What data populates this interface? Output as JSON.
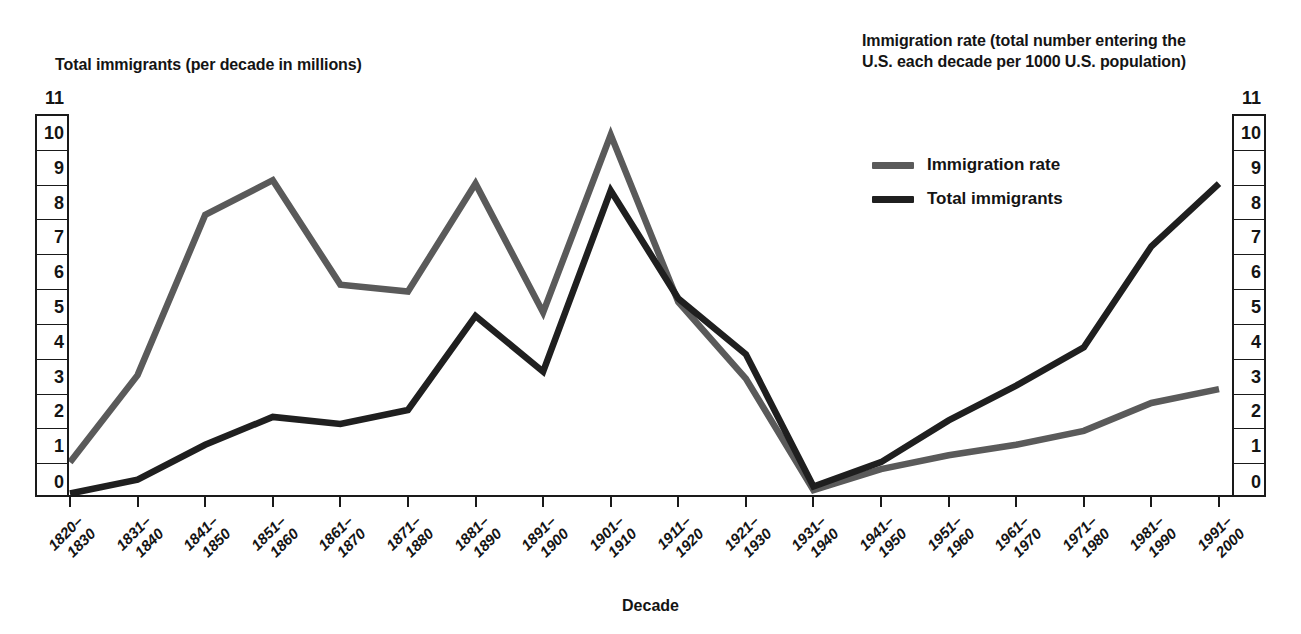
{
  "axes": {
    "left_title": "Total immigrants (per decade in millions)",
    "right_title": "Immigration rate (total number entering the\nU.S. each decade per 1000 U.S. population)",
    "x_title": "Decade",
    "tick_labels": [
      "11",
      "10",
      "9",
      "8",
      "7",
      "6",
      "5",
      "4",
      "3",
      "2",
      "1",
      "0"
    ]
  },
  "legend": {
    "items": [
      {
        "label": "Immigration rate",
        "color": "#5a5a5a"
      },
      {
        "label": "Total immigrants",
        "color": "#1f1f1f"
      }
    ]
  },
  "chart_data": {
    "type": "line",
    "title": "",
    "xlabel": "Decade",
    "ylabel": "Total immigrants (per decade in millions)",
    "y2label": "Immigration rate (total number entering the U.S. each decade per 1000 U.S. population)",
    "ylim": [
      0,
      11
    ],
    "y2lim": [
      0,
      11
    ],
    "grid": false,
    "legend_position": "upper-right",
    "categories": [
      "1820–\n1830",
      "1831–\n1840",
      "1841–\n1850",
      "1851–\n1860",
      "1861–\n1870",
      "1871–\n1880",
      "1881–\n1890",
      "1891–\n1900",
      "1901–\n1910",
      "1911–\n1920",
      "1921–\n1930",
      "1931–\n1940",
      "1941–\n1950",
      "1951–\n1960",
      "1961–\n1970",
      "1971–\n1980",
      "1981–\n1990",
      "1991–\n2000"
    ],
    "categories_flat": [
      "1820–1830",
      "1831–1840",
      "1841–1850",
      "1851–1860",
      "1861–1870",
      "1871–1880",
      "1881–1890",
      "1891–1900",
      "1901–1910",
      "1911–1920",
      "1921–1930",
      "1931–1940",
      "1941–1950",
      "1951–1960",
      "1961–1970",
      "1971–1980",
      "1981–1990",
      "1991–2000"
    ],
    "series": [
      {
        "name": "Immigration rate",
        "color": "#5a5a5a",
        "axis": "right",
        "values": [
          1.0,
          3.5,
          8.1,
          9.1,
          6.1,
          5.9,
          9.0,
          5.3,
          10.4,
          5.6,
          3.4,
          0.2,
          0.8,
          1.2,
          1.5,
          1.9,
          2.7,
          3.1
        ]
      },
      {
        "name": "Total immigrants",
        "color": "#1f1f1f",
        "axis": "left",
        "values": [
          0.1,
          0.5,
          1.5,
          2.3,
          2.1,
          2.5,
          5.2,
          3.6,
          8.8,
          5.7,
          4.1,
          0.3,
          1.0,
          2.2,
          3.2,
          4.3,
          7.2,
          9.0
        ]
      }
    ]
  }
}
